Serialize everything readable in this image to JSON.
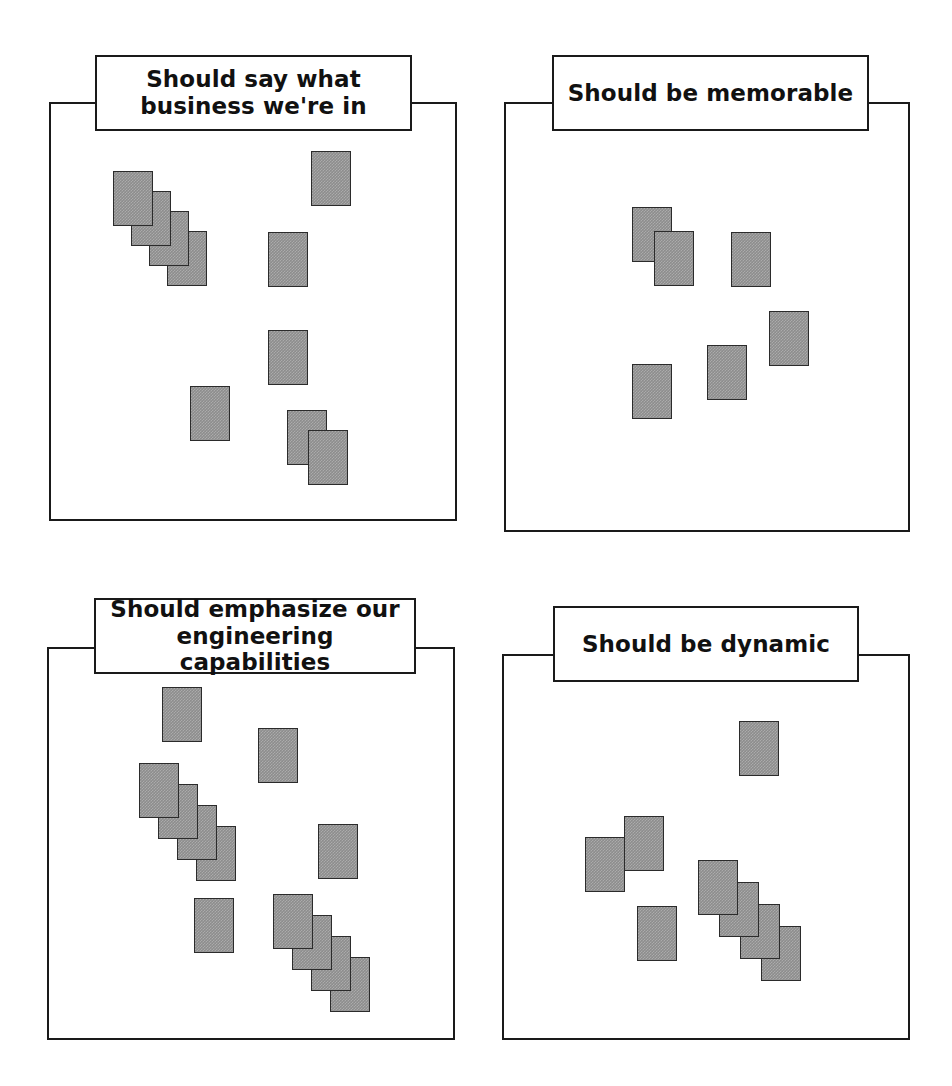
{
  "page": {
    "width": 952,
    "height": 1086,
    "background_color": "#ffffff",
    "note_fill_color": "#8d8d8d",
    "line_color": "#1a1a1a"
  },
  "panels": [
    {
      "id": "panel-business",
      "title": "Should say what\nbusiness we're in",
      "title_lines": [
        "Should say what",
        "business we're in"
      ],
      "frame": {
        "x": 50,
        "y": 103,
        "w": 406,
        "h": 417
      },
      "notch": {
        "x": 95,
        "w": 317
      },
      "title_box": {
        "x": 95,
        "y": 55,
        "w": 317,
        "h": 76
      },
      "note_count": 10,
      "notes": [
        {
          "x": 113,
          "y": 171,
          "w": 40,
          "h": 55,
          "z": 4
        },
        {
          "x": 131,
          "y": 191,
          "w": 40,
          "h": 55,
          "z": 3
        },
        {
          "x": 149,
          "y": 211,
          "w": 40,
          "h": 55,
          "z": 2
        },
        {
          "x": 167,
          "y": 231,
          "w": 40,
          "h": 55,
          "z": 1
        },
        {
          "x": 311,
          "y": 151,
          "w": 40,
          "h": 55,
          "z": 1
        },
        {
          "x": 268,
          "y": 232,
          "w": 40,
          "h": 55,
          "z": 1
        },
        {
          "x": 268,
          "y": 330,
          "w": 40,
          "h": 55,
          "z": 1
        },
        {
          "x": 190,
          "y": 386,
          "w": 40,
          "h": 55,
          "z": 1
        },
        {
          "x": 287,
          "y": 410,
          "w": 40,
          "h": 55,
          "z": 1
        },
        {
          "x": 308,
          "y": 430,
          "w": 40,
          "h": 55,
          "z": 2
        }
      ]
    },
    {
      "id": "panel-memorable",
      "title": "Should be memorable",
      "title_lines": [
        "Should be memorable"
      ],
      "frame": {
        "x": 505,
        "y": 103,
        "w": 404,
        "h": 428
      },
      "notch": {
        "x": 552,
        "w": 317
      },
      "title_box": {
        "x": 552,
        "y": 55,
        "w": 317,
        "h": 76
      },
      "note_count": 6,
      "notes": [
        {
          "x": 632,
          "y": 207,
          "w": 40,
          "h": 55,
          "z": 1
        },
        {
          "x": 654,
          "y": 231,
          "w": 40,
          "h": 55,
          "z": 2
        },
        {
          "x": 731,
          "y": 232,
          "w": 40,
          "h": 55,
          "z": 1
        },
        {
          "x": 769,
          "y": 311,
          "w": 40,
          "h": 55,
          "z": 1
        },
        {
          "x": 707,
          "y": 345,
          "w": 40,
          "h": 55,
          "z": 1
        },
        {
          "x": 632,
          "y": 364,
          "w": 40,
          "h": 55,
          "z": 1
        }
      ]
    },
    {
      "id": "panel-engineering",
      "title": "Should emphasize our\nengineering capabilities",
      "title_lines": [
        "Should emphasize our",
        "engineering capabilities"
      ],
      "frame": {
        "x": 48,
        "y": 648,
        "w": 406,
        "h": 391
      },
      "notch": {
        "x": 94,
        "w": 322
      },
      "title_box": {
        "x": 94,
        "y": 598,
        "w": 322,
        "h": 76
      },
      "note_count": 12,
      "notes": [
        {
          "x": 162,
          "y": 687,
          "w": 40,
          "h": 55,
          "z": 1
        },
        {
          "x": 258,
          "y": 728,
          "w": 40,
          "h": 55,
          "z": 1
        },
        {
          "x": 139,
          "y": 763,
          "w": 40,
          "h": 55,
          "z": 4
        },
        {
          "x": 158,
          "y": 784,
          "w": 40,
          "h": 55,
          "z": 3
        },
        {
          "x": 177,
          "y": 805,
          "w": 40,
          "h": 55,
          "z": 2
        },
        {
          "x": 196,
          "y": 826,
          "w": 40,
          "h": 55,
          "z": 1
        },
        {
          "x": 318,
          "y": 824,
          "w": 40,
          "h": 55,
          "z": 1
        },
        {
          "x": 194,
          "y": 898,
          "w": 40,
          "h": 55,
          "z": 1
        },
        {
          "x": 273,
          "y": 894,
          "w": 40,
          "h": 55,
          "z": 4
        },
        {
          "x": 292,
          "y": 915,
          "w": 40,
          "h": 55,
          "z": 3
        },
        {
          "x": 311,
          "y": 936,
          "w": 40,
          "h": 55,
          "z": 2
        },
        {
          "x": 330,
          "y": 957,
          "w": 40,
          "h": 55,
          "z": 1
        }
      ]
    },
    {
      "id": "panel-dynamic",
      "title": "Should be dynamic",
      "title_lines": [
        "Should be dynamic"
      ],
      "frame": {
        "x": 503,
        "y": 655,
        "w": 406,
        "h": 384
      },
      "notch": {
        "x": 553,
        "w": 306
      },
      "title_box": {
        "x": 553,
        "y": 606,
        "w": 306,
        "h": 76
      },
      "note_count": 8,
      "notes": [
        {
          "x": 739,
          "y": 721,
          "w": 40,
          "h": 55,
          "z": 1
        },
        {
          "x": 624,
          "y": 816,
          "w": 40,
          "h": 55,
          "z": 1
        },
        {
          "x": 585,
          "y": 837,
          "w": 40,
          "h": 55,
          "z": 2
        },
        {
          "x": 698,
          "y": 860,
          "w": 40,
          "h": 55,
          "z": 4
        },
        {
          "x": 719,
          "y": 882,
          "w": 40,
          "h": 55,
          "z": 3
        },
        {
          "x": 740,
          "y": 904,
          "w": 40,
          "h": 55,
          "z": 2
        },
        {
          "x": 761,
          "y": 926,
          "w": 40,
          "h": 55,
          "z": 1
        },
        {
          "x": 637,
          "y": 906,
          "w": 40,
          "h": 55,
          "z": 1
        }
      ]
    }
  ]
}
